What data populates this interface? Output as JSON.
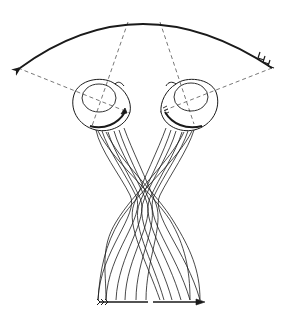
{
  "diagram": {
    "type": "visual-pathway-optic-chiasm",
    "colors": {
      "background": "#ffffff",
      "stroke": "#1a1a1a",
      "dashed": "#555555"
    },
    "elements": [
      {
        "name": "visual-field-arc",
        "description": "curved arrow spanning visual field, arrowhead left, fletching right"
      },
      {
        "name": "left-eye",
        "description": "left eyeball with lens circle and retina arrow"
      },
      {
        "name": "right-eye",
        "description": "right eyeball with lens circle and fletched retina arrow"
      },
      {
        "name": "optic-nerve-fibers",
        "description": "fiber bundles crossing at optic chiasm"
      },
      {
        "name": "bottom-arrow",
        "description": "horizontal arrow beneath fibers, fletching left, head right"
      }
    ],
    "fiber_count_per_side": 6
  }
}
